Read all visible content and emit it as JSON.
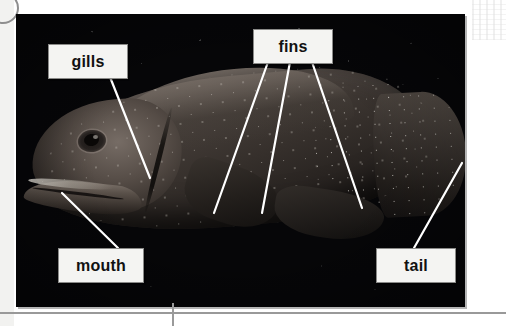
{
  "figure": {
    "photo_alt": "underwater photograph of a spotted grouper fish among dark coral reef",
    "labels": [
      {
        "id": "gills",
        "text": "gills",
        "box": {
          "x": 48,
          "y": 44,
          "w": 78,
          "h": 33
        },
        "leaders": [
          {
            "x1": 110,
            "y1": 77,
            "x2": 150,
            "y2": 178
          }
        ]
      },
      {
        "id": "fins",
        "text": "fins",
        "box": {
          "x": 253,
          "y": 29,
          "w": 78,
          "h": 33
        },
        "leaders": [
          {
            "x1": 268,
            "y1": 62,
            "x2": 214,
            "y2": 213
          },
          {
            "x1": 290,
            "y1": 62,
            "x2": 262,
            "y2": 213
          },
          {
            "x1": 312,
            "y1": 62,
            "x2": 362,
            "y2": 208
          }
        ]
      },
      {
        "id": "mouth",
        "text": "mouth",
        "box": {
          "x": 58,
          "y": 248,
          "w": 84,
          "h": 33
        },
        "leaders": [
          {
            "x1": 118,
            "y1": 248,
            "x2": 62,
            "y2": 193
          }
        ]
      },
      {
        "id": "tail",
        "text": "tail",
        "box": {
          "x": 376,
          "y": 248,
          "w": 78,
          "h": 33
        },
        "leaders": [
          {
            "x1": 414,
            "y1": 248,
            "x2": 462,
            "y2": 163
          }
        ]
      }
    ],
    "leader_color": "#ffffff",
    "label_background": "#f4f4f2",
    "label_border": "#8a8a88",
    "label_text_color": "#111111"
  },
  "page": {
    "background": "#ffffff",
    "margin_color": "#f2f2f0",
    "rule_color": "#999999",
    "binding_ring_color": "#8e8e8e"
  }
}
